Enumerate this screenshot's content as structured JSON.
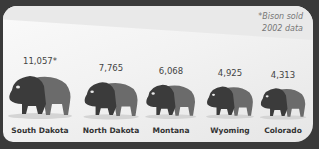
{
  "chart_data": {
    "type": "bar",
    "title": "",
    "categories": [
      "South Dakota",
      "North Dakota",
      "Montana",
      "Wyoming",
      "Colorado"
    ],
    "values": [
      11057,
      7765,
      6068,
      4925,
      4313
    ],
    "value_labels": [
      "11,057*",
      "7,765",
      "6,068",
      "4,925",
      "4,313"
    ],
    "annotation": "*Bison sold 2002 data",
    "xlabel": "",
    "ylabel": "",
    "grid": false
  },
  "note": {
    "line1": "*Bison sold",
    "line2": "2002 data"
  },
  "colors": {
    "bison_dark": "#3b3b3b",
    "bison_light": "#6b6b6b",
    "background": "#f3f3f3",
    "frame": "#3a3a3a"
  }
}
